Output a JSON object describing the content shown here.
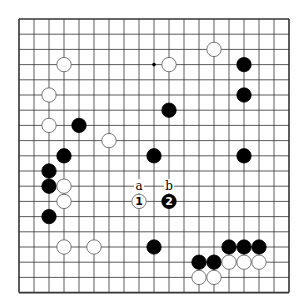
{
  "board": {
    "size": 19,
    "origin_x": 19,
    "origin_y": 19,
    "spacing_x": 15,
    "spacing_y": 15.2,
    "stone_radius": 7.2,
    "colors": {
      "line": "#333333",
      "black": "#000000",
      "white": "#ffffff",
      "stone_outline": "#555555"
    }
  },
  "hoshi": [
    [
      9,
      3
    ]
  ],
  "stones": [
    {
      "color": "white",
      "col": 3,
      "row": 3
    },
    {
      "color": "white",
      "col": 2,
      "row": 5
    },
    {
      "color": "white",
      "col": 2,
      "row": 7
    },
    {
      "color": "black",
      "col": 4,
      "row": 7
    },
    {
      "color": "white",
      "col": 6,
      "row": 8
    },
    {
      "color": "white",
      "col": 10,
      "row": 3
    },
    {
      "color": "white",
      "col": 13,
      "row": 2
    },
    {
      "color": "black",
      "col": 15,
      "row": 3
    },
    {
      "color": "black",
      "col": 15,
      "row": 5
    },
    {
      "color": "black",
      "col": 10,
      "row": 6
    },
    {
      "color": "black",
      "col": 3,
      "row": 9
    },
    {
      "color": "black",
      "col": 9,
      "row": 9
    },
    {
      "color": "black",
      "col": 15,
      "row": 9
    },
    {
      "color": "black",
      "col": 2,
      "row": 10
    },
    {
      "color": "black",
      "col": 2,
      "row": 11
    },
    {
      "color": "white",
      "col": 3,
      "row": 11
    },
    {
      "color": "white",
      "col": 3,
      "row": 12
    },
    {
      "color": "black",
      "col": 2,
      "row": 13
    },
    {
      "color": "white",
      "col": 8,
      "row": 12,
      "label": "1"
    },
    {
      "color": "black",
      "col": 10,
      "row": 12,
      "label": "2"
    },
    {
      "color": "white",
      "col": 3,
      "row": 15
    },
    {
      "color": "white",
      "col": 5,
      "row": 15
    },
    {
      "color": "black",
      "col": 9,
      "row": 15
    },
    {
      "color": "black",
      "col": 14,
      "row": 15
    },
    {
      "color": "black",
      "col": 15,
      "row": 15
    },
    {
      "color": "black",
      "col": 16,
      "row": 15
    },
    {
      "color": "black",
      "col": 12,
      "row": 16
    },
    {
      "color": "black",
      "col": 13,
      "row": 16
    },
    {
      "color": "white",
      "col": 14,
      "row": 16
    },
    {
      "color": "white",
      "col": 15,
      "row": 16
    },
    {
      "color": "white",
      "col": 16,
      "row": 16
    },
    {
      "color": "white",
      "col": 12,
      "row": 17
    },
    {
      "color": "white",
      "col": 13,
      "row": 17
    }
  ],
  "point_labels": [
    {
      "text": "a",
      "col": 8,
      "row": 11
    },
    {
      "text": "b",
      "col": 10,
      "row": 11
    }
  ]
}
